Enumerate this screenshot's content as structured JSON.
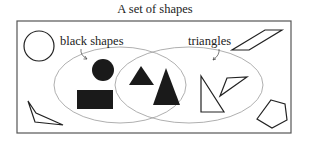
{
  "diagram": {
    "title": "A set of shapes",
    "type": "venn",
    "sets": [
      {
        "label": "black shapes",
        "members": [
          "black circle",
          "black rectangle",
          "black triangle (small)",
          "black triangle (tall)"
        ]
      },
      {
        "label": "triangles",
        "members": [
          "black triangle (small)",
          "black triangle (tall)",
          "white right triangle",
          "white obtuse triangle"
        ]
      }
    ],
    "intersection": [
      "black triangle (small)",
      "black triangle (tall)"
    ],
    "outside": [
      "white circle",
      "white parallelogram",
      "white obtuse triangle (bottom-left)",
      "white pentagon"
    ],
    "colors": {
      "stroke": "#222222",
      "fill_black": "#1a1a1a",
      "ellipse": "#999999",
      "frame": "#555555"
    }
  }
}
